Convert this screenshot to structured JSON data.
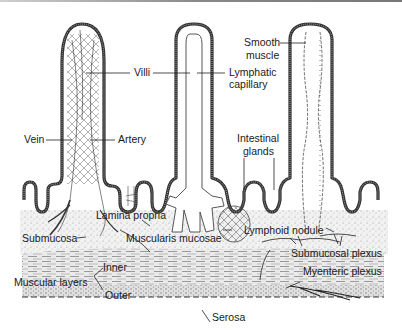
{
  "diagram": {
    "labels": {
      "villi": "Villi",
      "lymphatic_capillary_1": "Lymphatic",
      "lymphatic_capillary_2": "capillary",
      "smooth_muscle_1": "Smooth",
      "smooth_muscle_2": "muscle",
      "vein": "Vein",
      "artery": "Artery",
      "intestinal_glands_1": "Intestinal",
      "intestinal_glands_2": "glands",
      "lamina_propria": "Lamina propria",
      "submucosa": "Submucosa",
      "muscularis_mucosae": "Muscularis mucosae",
      "lymphoid_nodule": "Lymphoid nodule",
      "submucosal_plexus": "Submucosal plexus",
      "inner": "Inner",
      "muscular_layers": "Muscular layers",
      "myenteric_plexus": "Myenteric plexus",
      "outer": "Outer",
      "serosa": "Serosa"
    },
    "colors": {
      "outline": "#2a2a2a",
      "epithelium": "#555555",
      "tissue_fill": "#e8e8e8",
      "background": "#ffffff"
    }
  }
}
